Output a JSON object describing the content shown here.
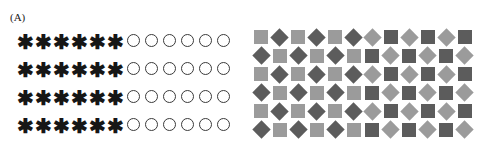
{
  "figure": {
    "background_color": "#ffffff",
    "panels": [
      {
        "id": "panel-a",
        "label": "(A)",
        "rows": 4,
        "columns": 12,
        "left_group": {
          "icon": "asterisk-star-icon",
          "glyph": "✱",
          "count_per_row": 6,
          "color": "#161616",
          "fill": "solid"
        },
        "right_group": {
          "icon": "circle-outline-icon",
          "glyph": "○",
          "count_per_row": 6,
          "color": "#3a3a3a",
          "fill": "none"
        },
        "grid": [
          [
            "star",
            "star",
            "star",
            "star",
            "star",
            "star",
            "circle",
            "circle",
            "circle",
            "circle",
            "circle",
            "circle"
          ],
          [
            "star",
            "star",
            "star",
            "star",
            "star",
            "star",
            "circle",
            "circle",
            "circle",
            "circle",
            "circle",
            "circle"
          ],
          [
            "star",
            "star",
            "star",
            "star",
            "star",
            "star",
            "circle",
            "circle",
            "circle",
            "circle",
            "circle",
            "circle"
          ],
          [
            "star",
            "star",
            "star",
            "star",
            "star",
            "star",
            "circle",
            "circle",
            "circle",
            "circle",
            "circle",
            "circle"
          ]
        ]
      },
      {
        "id": "panel-b",
        "label": "(B)",
        "rows": 6,
        "columns": 12,
        "colors": {
          "light_gray": "#9b9b9b",
          "dark_gray": "#5c5c5c"
        },
        "left_group": {
          "description": "light squares alternating with dark diamonds",
          "shapes": [
            "square",
            "diamond"
          ],
          "square_color": "#9b9b9b",
          "diamond_color": "#5c5c5c"
        },
        "right_group": {
          "description": "light diamonds alternating with dark squares",
          "shapes": [
            "diamond",
            "square"
          ],
          "diamond_color": "#9b9b9b",
          "square_color": "#5c5c5c"
        },
        "grid": [
          [
            "ls",
            "dd",
            "ls",
            "dd",
            "ls",
            "dd",
            "ld",
            "ds",
            "ld",
            "ds",
            "ld",
            "ds"
          ],
          [
            "dd",
            "ls",
            "dd",
            "ls",
            "dd",
            "ls",
            "ds",
            "ld",
            "ds",
            "ld",
            "ds",
            "ld"
          ],
          [
            "ls",
            "dd",
            "ls",
            "dd",
            "ls",
            "dd",
            "ld",
            "ds",
            "ld",
            "ds",
            "ld",
            "ds"
          ],
          [
            "dd",
            "ls",
            "dd",
            "ls",
            "dd",
            "ls",
            "ds",
            "ld",
            "ds",
            "ld",
            "ds",
            "ld"
          ],
          [
            "ls",
            "dd",
            "ls",
            "dd",
            "ls",
            "dd",
            "ld",
            "ds",
            "ld",
            "ds",
            "ld",
            "ds"
          ],
          [
            "dd",
            "ls",
            "dd",
            "ls",
            "dd",
            "ls",
            "ds",
            "ld",
            "ds",
            "ld",
            "ds",
            "ld"
          ]
        ]
      }
    ]
  }
}
